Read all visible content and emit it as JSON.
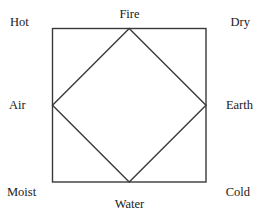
{
  "figure": {
    "kind": "four-elements-square-diagram",
    "stroke_color": "#3a3a3a",
    "background_color": "#ffffff",
    "text_color": "#1a1a1a",
    "square": {
      "left": 52,
      "top": 28,
      "right": 206,
      "bottom": 182
    },
    "diamond_vertices": {
      "top": [
        129,
        28
      ],
      "right": [
        206,
        105
      ],
      "bottom": [
        129,
        182
      ],
      "left": [
        52,
        105
      ]
    }
  },
  "labels": {
    "elements": {
      "fire": "Fire",
      "air": "Air",
      "earth": "Earth",
      "water": "Water"
    },
    "qualities": {
      "hot": "Hot",
      "dry": "Dry",
      "moist": "Moist",
      "cold": "Cold"
    }
  }
}
